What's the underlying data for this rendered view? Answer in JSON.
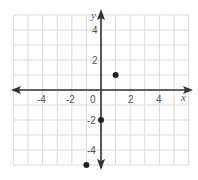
{
  "chart_data": {
    "type": "scatter",
    "title": "",
    "xlabel": "x",
    "ylabel": "y",
    "xlim": [
      -6,
      6
    ],
    "ylim": [
      -5,
      5
    ],
    "grid": true,
    "legend": null,
    "x_tick_labels": [
      "-4",
      "-2",
      "0",
      "2",
      "4"
    ],
    "y_tick_labels": [
      "4",
      "2",
      "-2",
      "-4"
    ],
    "points": [
      {
        "x": 1,
        "y": 1
      },
      {
        "x": 0,
        "y": -2
      },
      {
        "x": -1,
        "y": -5
      }
    ]
  },
  "labels": {
    "origin": "0",
    "x_axis": "x",
    "y_axis": "y",
    "x_neg4": "-4",
    "x_neg2": "-2",
    "x_2": "2",
    "x_4": "4",
    "y_4": "4",
    "y_2": "2",
    "y_neg2": "-2",
    "y_neg4": "-4"
  },
  "colors": {
    "grid": "#d9d9d9",
    "axis": "#333333",
    "point": "#222222",
    "label": "#555555"
  }
}
